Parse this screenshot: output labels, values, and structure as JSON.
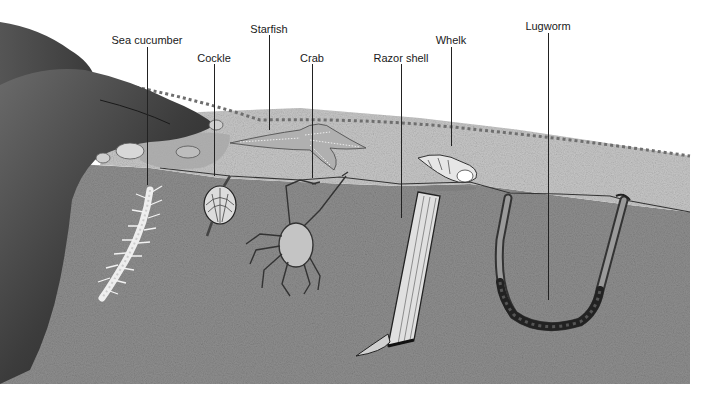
{
  "diagram": {
    "labels": [
      {
        "id": "sea-cucumber",
        "text": "Sea cucumber",
        "x": 147,
        "y": 34,
        "line_x": 147,
        "line_top": 47,
        "line_bottom": 185
      },
      {
        "id": "cockle",
        "text": "Cockle",
        "x": 214,
        "y": 52,
        "line_x": 214,
        "line_top": 64,
        "line_bottom": 176
      },
      {
        "id": "starfish",
        "text": "Starfish",
        "x": 269,
        "y": 23,
        "line_x": 269,
        "line_top": 35,
        "line_bottom": 130
      },
      {
        "id": "crab",
        "text": "Crab",
        "x": 312,
        "y": 52,
        "line_x": 312,
        "line_top": 64,
        "line_bottom": 178
      },
      {
        "id": "razor-shell",
        "text": "Razor shell",
        "x": 401,
        "y": 52,
        "line_x": 401,
        "line_top": 64,
        "line_bottom": 218
      },
      {
        "id": "whelk",
        "text": "Whelk",
        "x": 451,
        "y": 34,
        "line_x": 451,
        "line_top": 47,
        "line_bottom": 146
      },
      {
        "id": "lugworm",
        "text": "Lugworm",
        "x": 548,
        "y": 20,
        "line_x": 548,
        "line_top": 33,
        "line_bottom": 300
      }
    ],
    "colors": {
      "rock_dark": "#2e2e2e",
      "rock_mid": "#5a5a5a",
      "sand_surface": "#c9c9c9",
      "sand_subsurface": "#8e8e8e",
      "line": "#222222",
      "background": "#ffffff"
    }
  }
}
